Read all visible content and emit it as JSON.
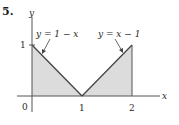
{
  "problem_number": "5.",
  "axes": {
    "x_label": "x",
    "y_label": "y",
    "origin_label": "0",
    "x_ticks": [
      "1",
      "2"
    ],
    "y_ticks": [
      "1"
    ]
  },
  "curves": [
    {
      "label": "y = 1 − x",
      "from": [
        0,
        1
      ],
      "to": [
        1,
        0
      ]
    },
    {
      "label": "y = x − 1",
      "from": [
        1,
        0
      ],
      "to": [
        2,
        1
      ]
    }
  ],
  "shaded_region": {
    "description": "area between curves and x-axis from x=0 to x=2",
    "color": "#dcdcdc"
  },
  "colors": {
    "axis": "#555555",
    "line": "#444444",
    "fill": "#dcdcdc"
  }
}
